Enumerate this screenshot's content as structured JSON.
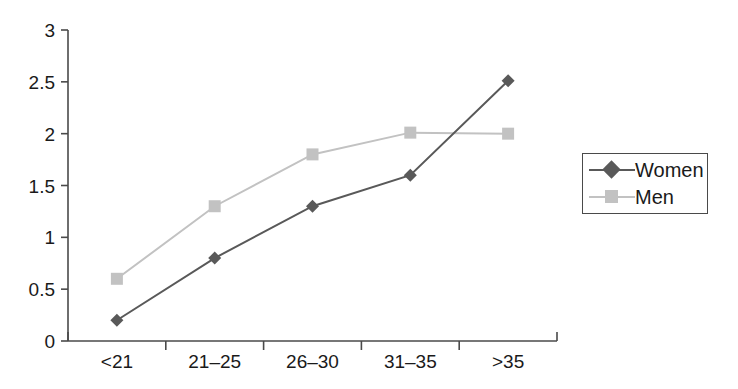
{
  "chart_data": {
    "type": "line",
    "title": "",
    "xlabel": "",
    "ylabel": "",
    "categories": [
      "<21",
      "21–25",
      "26–30",
      "31–35",
      ">35"
    ],
    "series": [
      {
        "name": "Women",
        "values": [
          0.2,
          0.8,
          1.3,
          1.6,
          2.51
        ],
        "color": "#595959",
        "marker": "diamond"
      },
      {
        "name": "Men",
        "values": [
          0.6,
          1.3,
          1.8,
          2.01,
          2.0
        ],
        "color": "#c2c2c2",
        "marker": "square"
      }
    ],
    "ylim": [
      0,
      3
    ],
    "yticks": [
      0,
      0.5,
      1,
      1.5,
      2,
      2.5,
      3
    ],
    "ytick_labels": [
      "0",
      "0.5",
      "1",
      "1.5",
      "2",
      "2.5",
      "3"
    ],
    "grid": false,
    "legend_position": "right"
  },
  "legend": {
    "entries": [
      {
        "label": "Women"
      },
      {
        "label": "Men"
      }
    ]
  },
  "axes": {
    "y_axis_color": "#4a4a4a",
    "x_axis_color": "#4a4a4a"
  }
}
